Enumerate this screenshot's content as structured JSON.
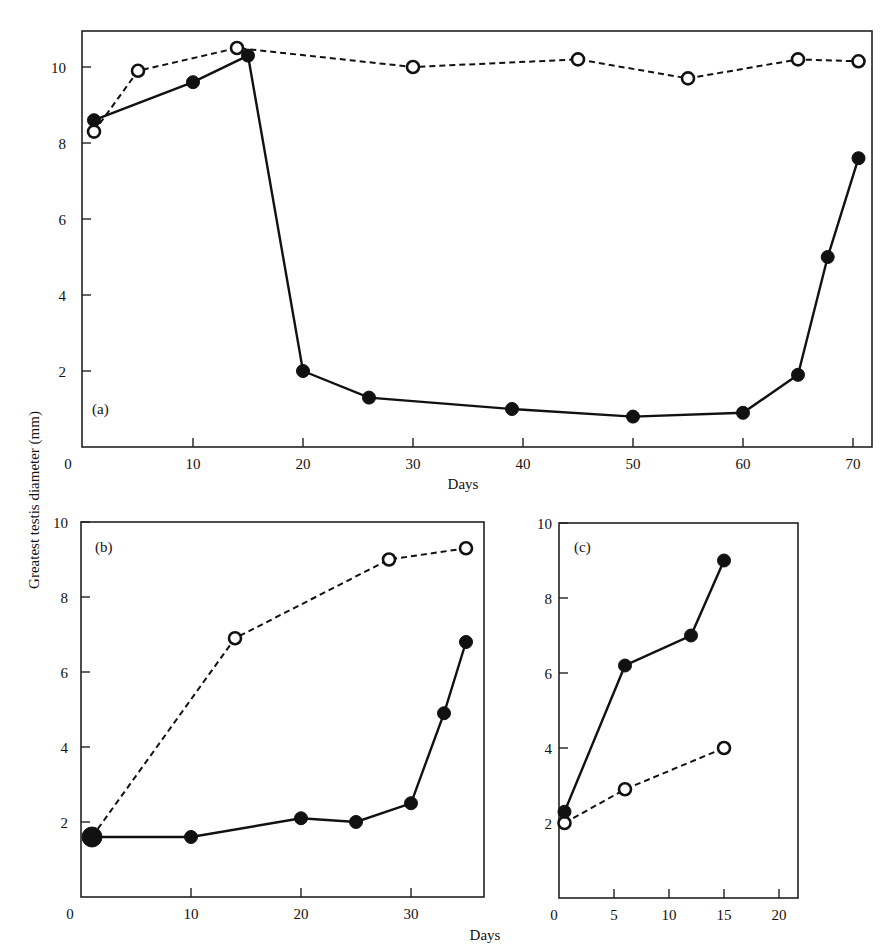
{
  "figure": {
    "ylabel": "Greatest testis diameter (mm)",
    "xlabel_a": "Days",
    "xlabel_bc": "Days"
  },
  "chart_data": [
    {
      "type": "line",
      "panel_label": "(a)",
      "title": "",
      "xlabel": "Days",
      "ylabel": "Greatest testis diameter (mm)",
      "xlim": [
        0,
        72
      ],
      "ylim": [
        0,
        11
      ],
      "xticks": [
        0,
        10,
        20,
        30,
        40,
        50,
        60,
        70
      ],
      "yticks": [
        2,
        4,
        6,
        8,
        10
      ],
      "grid": false,
      "series": [
        {
          "name": "filled circles (solid line)",
          "marker": "filled",
          "line": "solid",
          "x": [
            1,
            10,
            15,
            20,
            26,
            39,
            50,
            60,
            65,
            67.7,
            70.5
          ],
          "y": [
            8.6,
            9.6,
            10.3,
            2.0,
            1.3,
            1.0,
            0.8,
            0.9,
            1.9,
            5.0,
            7.6
          ]
        },
        {
          "name": "open circles (dashed line)",
          "marker": "open",
          "line": "dashed",
          "x": [
            1,
            5,
            14,
            30,
            45,
            55,
            65,
            70.5
          ],
          "y": [
            8.3,
            9.9,
            10.5,
            10.0,
            10.2,
            9.7,
            10.2,
            10.15
          ]
        }
      ]
    },
    {
      "type": "line",
      "panel_label": "(b)",
      "title": "",
      "xlabel": "Days",
      "ylabel": "Greatest testis diameter (mm)",
      "xlim": [
        0,
        37
      ],
      "ylim": [
        0,
        10
      ],
      "xticks": [
        0,
        10,
        20,
        30
      ],
      "yticks": [
        2,
        4,
        6,
        8,
        10
      ],
      "grid": false,
      "series": [
        {
          "name": "filled circles (solid line)",
          "marker": "filled",
          "line": "solid",
          "x": [
            1,
            10,
            20,
            25,
            30,
            33,
            35
          ],
          "y": [
            1.6,
            1.6,
            2.1,
            2.0,
            2.5,
            4.9,
            6.8
          ]
        },
        {
          "name": "open circles (dashed line)",
          "marker": "open",
          "line": "dashed",
          "x": [
            1,
            14,
            28,
            35
          ],
          "y": [
            1.6,
            6.9,
            9.0,
            9.3
          ]
        }
      ]
    },
    {
      "type": "line",
      "panel_label": "(c)",
      "title": "",
      "xlabel": "Days",
      "ylabel": "Greatest testis diameter (mm)",
      "xlim": [
        0,
        21.5
      ],
      "ylim": [
        0,
        10
      ],
      "xticks": [
        0,
        5,
        10,
        15,
        20
      ],
      "yticks": [
        2,
        4,
        6,
        8,
        10
      ],
      "grid": false,
      "series": [
        {
          "name": "filled circles (solid line)",
          "marker": "filled",
          "line": "solid",
          "x": [
            0.5,
            6,
            12,
            15
          ],
          "y": [
            2.3,
            6.2,
            7.0,
            9.0
          ]
        },
        {
          "name": "open circles (dashed line)",
          "marker": "open",
          "line": "dashed",
          "x": [
            0.5,
            6,
            15
          ],
          "y": [
            2.0,
            2.9,
            4.0
          ]
        }
      ]
    }
  ],
  "layout": {
    "panels": [
      {
        "x0px": 83,
        "xscale": 11.0,
        "y0px": 447,
        "yscale": 38.0,
        "box": [
          82,
          31,
          872,
          447
        ],
        "label_pos": [
          92,
          414
        ],
        "ytick_label_x": 58,
        "xtick_label_y": 469
      },
      {
        "x0px": 81,
        "xscale": 11.0,
        "y0px": 897,
        "yscale": 37.5,
        "box": [
          81,
          522,
          484,
          897
        ],
        "label_pos": [
          95,
          552
        ],
        "ytick_label_x": 60,
        "xtick_label_y": 919,
        "label_top_left": true
      },
      {
        "x0px": 559,
        "xscale": 11.0,
        "y0px": 898,
        "yscale": 37.5,
        "box": [
          559,
          523,
          798,
          898
        ],
        "label_pos": [
          574,
          552
        ],
        "ytick_label_x": 544,
        "xtick_label_y": 920,
        "label_top_left": true
      }
    ]
  }
}
